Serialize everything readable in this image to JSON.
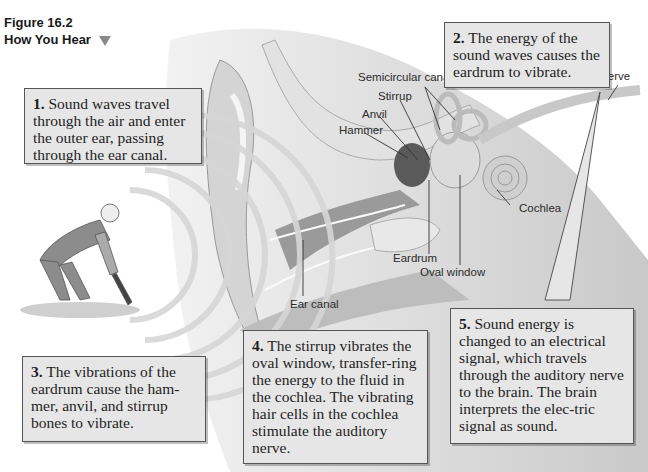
{
  "figure": {
    "number": "Figure 16.2",
    "title": "How You Hear",
    "marker_icon": "triangle-down-icon",
    "top_cut_text": "semicircular canals and ..."
  },
  "callouts": [
    {
      "num": "1.",
      "text": "Sound waves travel through the air and enter the outer ear, passing through the ear canal."
    },
    {
      "num": "2.",
      "text": "The energy of the sound waves causes the eardrum to vibrate."
    },
    {
      "num": "3.",
      "text": "The vibrations of the eardrum cause the ham-mer, anvil, and stirrup bones to vibrate."
    },
    {
      "num": "4.",
      "text": "The stirrup vibrates the oval window, transfer-ring the energy to the fluid in the cochlea. The vibrating hair cells in the cochlea stimulate the auditory nerve."
    },
    {
      "num": "5.",
      "text": "Sound energy is changed to an electrical signal,  which travels through the auditory nerve to the brain. The brain interprets the elec-tric signal as sound."
    }
  ],
  "labels": {
    "semicircular_canals": "Semicircular canals",
    "stirrup": "Stirrup",
    "anvil": "Anvil",
    "hammer": "Hammer",
    "auditory_nerve": "Auditory nerve",
    "cochlea": "Cochlea",
    "eardrum": "Eardrum",
    "oval_window": "Oval window",
    "ear_canal": "Ear canal"
  },
  "colors": {
    "callout_bg": "#e6e6e6",
    "callout_border": "#555555",
    "triangle": "#8a8a8a"
  }
}
